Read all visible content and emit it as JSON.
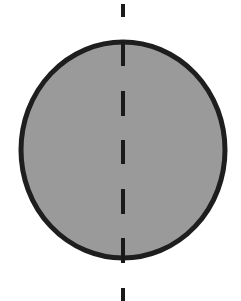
{
  "diagram": {
    "type": "ellipse-with-axis",
    "ellipse": {
      "cx": 123,
      "cy": 150,
      "rx": 102,
      "ry": 108,
      "fill": "#9a9a9a",
      "stroke": "#1e1e1e",
      "stroke_width": 5
    },
    "axis": {
      "x": 123,
      "orientation": "vertical",
      "style": "dashed",
      "color": "#1a1a1a",
      "width": 4,
      "dashes": [
        {
          "y1": 4,
          "y2": 17
        },
        {
          "y1": 42,
          "y2": 66
        },
        {
          "y1": 91,
          "y2": 116
        },
        {
          "y1": 140,
          "y2": 164
        },
        {
          "y1": 189,
          "y2": 214
        },
        {
          "y1": 238,
          "y2": 263
        },
        {
          "y1": 288,
          "y2": 301
        }
      ]
    }
  }
}
